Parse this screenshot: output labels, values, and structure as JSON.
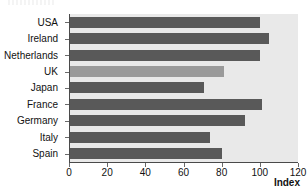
{
  "figure": {
    "background_color": "#ffffff",
    "plot_background_color": "#e9e9e9",
    "axis_color": "#4a4a4a"
  },
  "chart_data": {
    "type": "bar",
    "orientation": "horizontal",
    "title": "",
    "xlabel": "Index",
    "ylabel": "",
    "categories": [
      "USA",
      "Ireland",
      "Netherlands",
      "UK",
      "Japan",
      "France",
      "Germany",
      "Italy",
      "Spain"
    ],
    "values": [
      100,
      105,
      100,
      81,
      71,
      101,
      92,
      74,
      80
    ],
    "xlim": [
      0,
      120
    ],
    "xticks": [
      0,
      20,
      40,
      60,
      80,
      100,
      120
    ],
    "xtick_labels": [
      "0",
      "20",
      "40",
      "60",
      "80",
      "100",
      "120"
    ],
    "grid": false,
    "legend": null,
    "bar_color": "#595959",
    "highlight_color": "#9a9a9a",
    "highlighted_categories": [
      "UK"
    ],
    "bars": [
      {
        "label": "USA",
        "value": 100,
        "highlighted": false
      },
      {
        "label": "Ireland",
        "value": 105,
        "highlighted": false
      },
      {
        "label": "Netherlands",
        "value": 100,
        "highlighted": false
      },
      {
        "label": "UK",
        "value": 81,
        "highlighted": true
      },
      {
        "label": "Japan",
        "value": 71,
        "highlighted": false
      },
      {
        "label": "France",
        "value": 101,
        "highlighted": false
      },
      {
        "label": "Germany",
        "value": 92,
        "highlighted": false
      },
      {
        "label": "Italy",
        "value": 74,
        "highlighted": false
      },
      {
        "label": "Spain",
        "value": 80,
        "highlighted": false
      }
    ]
  }
}
